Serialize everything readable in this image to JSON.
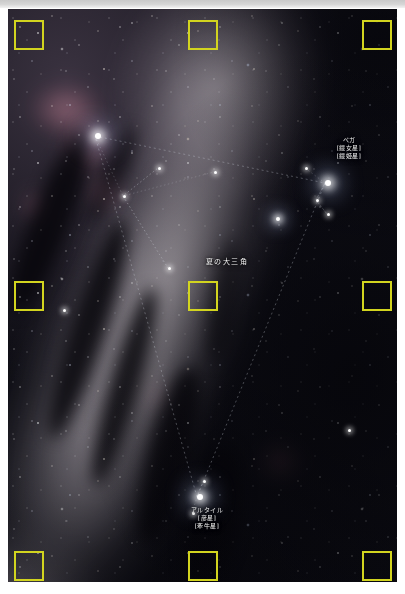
{
  "screenshot": {
    "width": 405,
    "height": 594,
    "type": "annotated-astrophotography",
    "background_color": "#ffffff"
  },
  "photo": {
    "subject": "Milky Way with the Summer Triangle",
    "orientation": "portrait",
    "dominant_colors": [
      "#0a0910",
      "#17141c",
      "#d9d2d8",
      "#e2849 6"
    ],
    "nebula_color": "#e2849a",
    "dust_lane_color": "#07060b"
  },
  "annotations": {
    "labels": [
      {
        "id": "vega",
        "lines": [
          "ベガ",
          "[織女星]",
          "[織姫星]"
        ],
        "x": 341,
        "y": 136,
        "star_x": 325,
        "star_y": 183
      },
      {
        "id": "summer-triangle",
        "lines": [
          "夏の大三角"
        ],
        "x": 219,
        "y": 258,
        "style": "big"
      },
      {
        "id": "altair",
        "lines": [
          "アルタイル",
          "[彦星]",
          "[牽牛星]"
        ],
        "x": 207,
        "y": 506,
        "star_x": 197,
        "star_y": 497
      }
    ],
    "stars": [
      {
        "id": "deneb",
        "x": 95,
        "y": 136,
        "size": "big"
      },
      {
        "id": "vega",
        "x": 325,
        "y": 183,
        "size": "big"
      },
      {
        "id": "altair",
        "x": 197,
        "y": 497,
        "size": "big"
      },
      {
        "id": "sadr",
        "x": 123,
        "y": 196,
        "size": "sm"
      },
      {
        "id": "albireo",
        "x": 168,
        "y": 268,
        "size": "sm"
      },
      {
        "id": "delta-cygni",
        "x": 158,
        "y": 168,
        "size": "sm"
      },
      {
        "id": "epsilon-cygni",
        "x": 214,
        "y": 172,
        "size": "sm"
      },
      {
        "id": "epsilon-lyrae",
        "x": 305,
        "y": 168,
        "size": "sm"
      },
      {
        "id": "zeta-lyrae",
        "x": 316,
        "y": 200,
        "size": "sm"
      },
      {
        "id": "gamma-lyrae",
        "x": 327,
        "y": 214,
        "size": "sm"
      },
      {
        "id": "tarazed",
        "x": 203,
        "y": 481,
        "size": "sm"
      },
      {
        "id": "alshain",
        "x": 192,
        "y": 513,
        "size": "sm"
      }
    ]
  },
  "markers": {
    "color": "#d2d41f",
    "border_width": 2,
    "shape": "square-outline",
    "size": 30,
    "items": [
      {
        "name": "marker-top-left",
        "x": 14,
        "y": 20,
        "w": 30,
        "h": 30
      },
      {
        "name": "marker-top-center",
        "x": 188,
        "y": 20,
        "w": 30,
        "h": 30
      },
      {
        "name": "marker-top-right",
        "x": 362,
        "y": 20,
        "w": 30,
        "h": 30
      },
      {
        "name": "marker-middle-left",
        "x": 14,
        "y": 281,
        "w": 30,
        "h": 30
      },
      {
        "name": "marker-center",
        "x": 188,
        "y": 281,
        "w": 30,
        "h": 30
      },
      {
        "name": "marker-middle-right",
        "x": 362,
        "y": 281,
        "w": 30,
        "h": 30
      },
      {
        "name": "marker-bottom-left",
        "x": 14,
        "y": 551,
        "w": 30,
        "h": 30
      },
      {
        "name": "marker-bottom-center",
        "x": 188,
        "y": 551,
        "w": 30,
        "h": 30
      },
      {
        "name": "marker-bottom-right",
        "x": 362,
        "y": 551,
        "w": 30,
        "h": 30
      }
    ]
  }
}
